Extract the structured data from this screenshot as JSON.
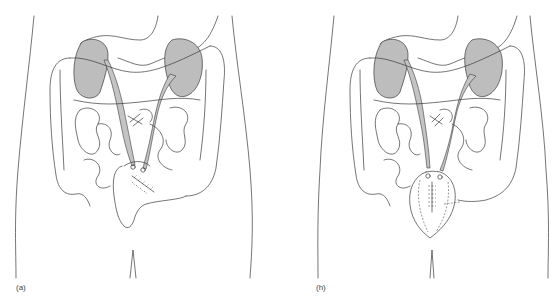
{
  "figure": {
    "panels": [
      {
        "id": "a",
        "label": "(a)",
        "depiction": "abdomen with shaded kidneys, ureters implanted into sigmoid/rectal pouch with sutured reconstruction"
      },
      {
        "id": "h",
        "label": "(h)",
        "depiction": "abdomen with shaded kidneys, ureters implanted into completed oval rectosigmoid pouch with central suture line"
      }
    ],
    "colors": {
      "kidney_fill": "#bdbdbd",
      "line": "#3a3a3a",
      "background": "#ffffff"
    }
  }
}
